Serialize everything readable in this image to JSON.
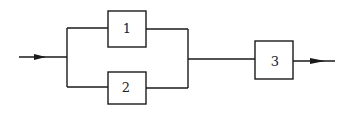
{
  "diagram": {
    "type": "reliability-block-diagram",
    "blocks": [
      {
        "id": "1",
        "label": "1"
      },
      {
        "id": "2",
        "label": "2"
      },
      {
        "id": "3",
        "label": "3"
      }
    ],
    "connections": [
      {
        "from": "input",
        "to": "parallel-group"
      },
      {
        "from": "parallel-group",
        "to": "3"
      },
      {
        "from": "3",
        "to": "output"
      }
    ],
    "parallel_group": [
      "1",
      "2"
    ],
    "colors": {
      "stroke": "#1a1a1a",
      "background": "#ffffff"
    }
  }
}
